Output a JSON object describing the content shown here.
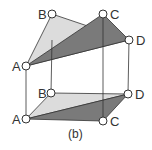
{
  "figure": {
    "caption": "(b)",
    "colors": {
      "light_face": "#dcdcdc",
      "dark_face": "#7a7a7a",
      "edge": "#333333",
      "vertex_fill": "#ffffff"
    },
    "top_plane": {
      "vertices": [
        {
          "label": "B",
          "x": 52,
          "y": 14
        },
        {
          "label": "C",
          "x": 103,
          "y": 14
        },
        {
          "label": "D",
          "x": 129,
          "y": 40
        },
        {
          "label": "A",
          "x": 26,
          "y": 66
        }
      ]
    },
    "bottom_plane": {
      "vertices": [
        {
          "label": "B",
          "x": 51,
          "y": 93
        },
        {
          "label": "D",
          "x": 128,
          "y": 94
        },
        {
          "label": "A",
          "x": 26,
          "y": 119
        },
        {
          "label": "C",
          "x": 103,
          "y": 121
        }
      ]
    }
  }
}
